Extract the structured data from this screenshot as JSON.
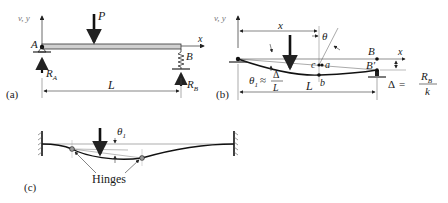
{
  "panels": {
    "a": {
      "caption": "(a)",
      "axis_label": "v, y",
      "x_label": "x",
      "load_label": "P",
      "point_a": "A",
      "point_b": "B",
      "reaction_a": "R",
      "reaction_a_sub": "A",
      "reaction_b": "R",
      "reaction_b_sub": "B",
      "span_label": "L"
    },
    "b": {
      "caption": "(b)",
      "axis_label": "v, y",
      "x_label": "x",
      "dist_label": "x",
      "theta_label": "θ",
      "theta1_label": "θ",
      "theta1_sub": "1",
      "approx": "≈",
      "frac_num": "Δ",
      "frac_den": "L",
      "point_c": "c",
      "point_a": "a",
      "point_b": "b",
      "point_B": "B",
      "point_Bprime": "B′",
      "span_label": "L",
      "delta_label": "Δ",
      "equals": "=",
      "rb_num": "R",
      "rb_num_sub": "B",
      "rb_den": "k"
    },
    "c": {
      "caption": "(c)",
      "theta_label": "θ",
      "theta_sub": "1",
      "hinges_label": "Hinges"
    }
  }
}
